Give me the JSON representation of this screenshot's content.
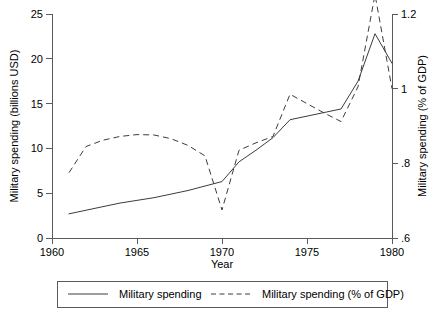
{
  "chart_data": {
    "type": "line",
    "title": "",
    "xlabel": "Year",
    "ylabel": "Military spending (billions USD)",
    "y2label": "Military spending (% of GDP)",
    "xlim": [
      1960,
      1980
    ],
    "ylim": [
      0,
      25
    ],
    "y2lim": [
      0.6,
      1.2
    ],
    "grid": false,
    "legend_position": "bottom",
    "xticks": [
      "1960",
      "1965",
      "1970",
      "1975",
      "1980"
    ],
    "xtick_values": [
      1960,
      1965,
      1970,
      1975,
      1980
    ],
    "yticks": [
      "0",
      "5",
      "10",
      "15",
      "20",
      "25"
    ],
    "ytick_values": [
      0,
      5,
      10,
      15,
      20,
      25
    ],
    "y2ticks": [
      ".6",
      ".8",
      "1",
      "1.2"
    ],
    "y2tick_values": [
      0.6,
      0.8,
      1.0,
      1.2
    ],
    "x": [
      1961,
      1962,
      1963,
      1964,
      1965,
      1966,
      1967,
      1968,
      1969,
      1970,
      1971,
      1972,
      1973,
      1974,
      1975,
      1976,
      1977,
      1978,
      1979,
      1980
    ],
    "series": [
      {
        "name": "Military spending",
        "axis": "left",
        "style": "solid",
        "color": "#3c3c3c",
        "values": [
          2.7,
          3.1,
          3.5,
          3.9,
          4.2,
          4.5,
          4.9,
          5.3,
          5.8,
          6.3,
          8.5,
          9.8,
          11.2,
          13.2,
          13.6,
          14.0,
          14.4,
          17.5,
          22.8,
          19.5
        ]
      },
      {
        "name": "Military spending (% of GDP)",
        "axis": "right",
        "style": "dashed",
        "color": "#3c3c3c",
        "values": [
          0.775,
          0.845,
          0.862,
          0.872,
          0.877,
          0.876,
          0.866,
          0.848,
          0.82,
          0.675,
          0.835,
          0.855,
          0.872,
          0.985,
          0.96,
          0.935,
          0.912,
          1.005,
          1.252,
          1.0
        ]
      }
    ],
    "legend": [
      {
        "label": "Military spending",
        "style": "solid"
      },
      {
        "label": "Military spending (% of GDP)",
        "style": "dashed"
      }
    ]
  }
}
